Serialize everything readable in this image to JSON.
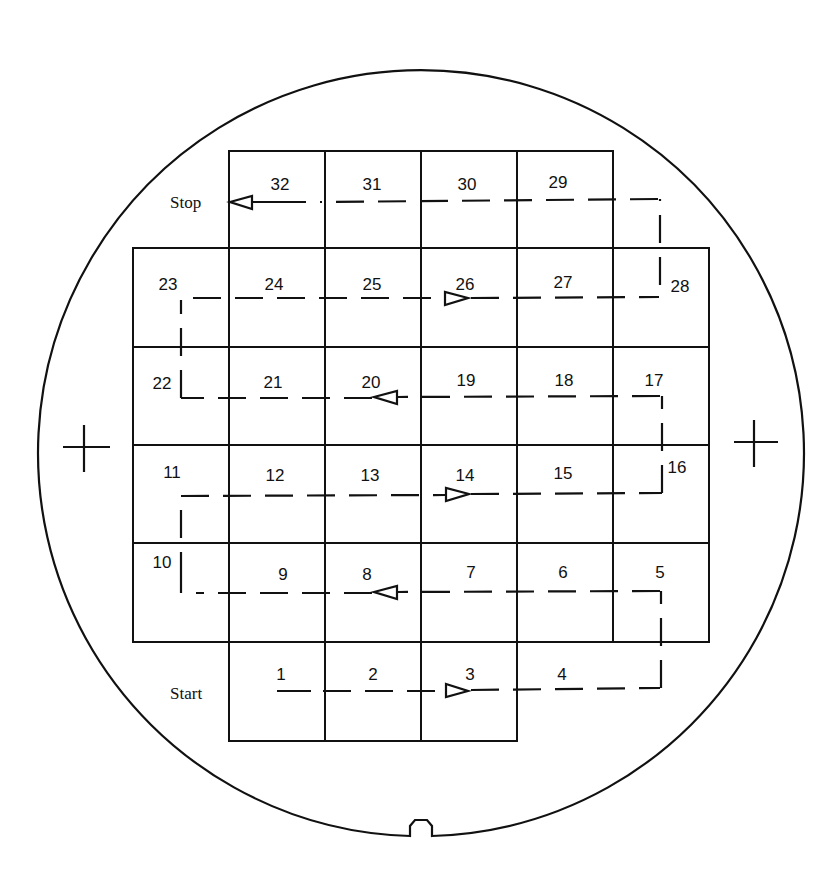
{
  "diagram": {
    "labels": {
      "start": "Start",
      "stop": "Stop"
    },
    "colors": {
      "line": "#111111",
      "background": "#ffffff"
    },
    "wafer": {
      "cx": 419,
      "cy": 441,
      "r": 383,
      "notch": "bottom"
    },
    "alignment_marks": [
      {
        "name": "left-crosshair",
        "x": 84,
        "y": 447
      },
      {
        "name": "right-crosshair",
        "x": 756,
        "y": 442
      }
    ],
    "dies": [
      {
        "n": "1",
        "x": 281,
        "y": 680
      },
      {
        "n": "2",
        "x": 373,
        "y": 680
      },
      {
        "n": "3",
        "x": 470,
        "y": 680
      },
      {
        "n": "4",
        "x": 562,
        "y": 680
      },
      {
        "n": "5",
        "x": 660,
        "y": 578
      },
      {
        "n": "6",
        "x": 563,
        "y": 578
      },
      {
        "n": "7",
        "x": 471,
        "y": 578
      },
      {
        "n": "8",
        "x": 367,
        "y": 580
      },
      {
        "n": "9",
        "x": 283,
        "y": 580
      },
      {
        "n": "10",
        "x": 162,
        "y": 568
      },
      {
        "n": "11",
        "x": 172,
        "y": 478
      },
      {
        "n": "12",
        "x": 275,
        "y": 481
      },
      {
        "n": "13",
        "x": 370,
        "y": 481
      },
      {
        "n": "14",
        "x": 465,
        "y": 481
      },
      {
        "n": "15",
        "x": 563,
        "y": 479
      },
      {
        "n": "16",
        "x": 677,
        "y": 473
      },
      {
        "n": "17",
        "x": 654,
        "y": 386
      },
      {
        "n": "18",
        "x": 564,
        "y": 386
      },
      {
        "n": "19",
        "x": 466,
        "y": 386
      },
      {
        "n": "20",
        "x": 371,
        "y": 388
      },
      {
        "n": "21",
        "x": 273,
        "y": 388
      },
      {
        "n": "22",
        "x": 162,
        "y": 389
      },
      {
        "n": "23",
        "x": 168,
        "y": 290
      },
      {
        "n": "24",
        "x": 274,
        "y": 290
      },
      {
        "n": "25",
        "x": 372,
        "y": 290
      },
      {
        "n": "26",
        "x": 465,
        "y": 290
      },
      {
        "n": "27",
        "x": 563,
        "y": 288
      },
      {
        "n": "28",
        "x": 680,
        "y": 292
      },
      {
        "n": "29",
        "x": 558,
        "y": 188
      },
      {
        "n": "30",
        "x": 467,
        "y": 190
      },
      {
        "n": "31",
        "x": 372,
        "y": 190
      },
      {
        "n": "32",
        "x": 280,
        "y": 190
      }
    ]
  }
}
